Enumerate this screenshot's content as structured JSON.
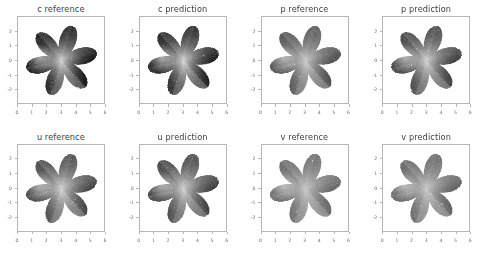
{
  "figure": {
    "rows": 2,
    "cols": 4,
    "background_color": "#ffffff",
    "axes_edge_color": "#b6b6b6",
    "tick_label_color": "#6f6f6f",
    "title_color": "#3d3d3d"
  },
  "chart_data": {
    "type": "scatter",
    "title": "",
    "subtitle": "",
    "xlabel": "",
    "ylabel": "",
    "grid": false,
    "legend": null,
    "colormap": "gray_r",
    "shared_axes": {
      "xlim": [
        0,
        6
      ],
      "ylim": [
        -3,
        3
      ],
      "xticks": [
        0,
        1,
        2,
        3,
        4,
        5,
        6
      ],
      "xticklabels": [
        "0",
        "1",
        "2",
        "3",
        "4",
        "5",
        "6"
      ],
      "yticks": [
        -2,
        -1,
        0,
        1,
        2
      ],
      "yticklabels": [
        "-2",
        "-1",
        "0",
        "1",
        "2"
      ]
    },
    "geometry": {
      "shape": "six-petal flower point cloud",
      "petals": 6,
      "center_x": 3.0,
      "center_y": 0.0,
      "inner_radius": 0.55,
      "outer_radius": 2.5,
      "rotation_deg": 12
    },
    "panels": [
      {
        "id": "c-reference",
        "title": "c reference",
        "field": "c",
        "kind": "reference",
        "row": 0,
        "col": 0,
        "value_range": [
          0.0,
          1.0
        ],
        "contrast": 1.0,
        "center_brightness": 0.82,
        "petal_brightness": 0.18,
        "seed": 11
      },
      {
        "id": "c-prediction",
        "title": "c prediction",
        "field": "c",
        "kind": "prediction",
        "row": 0,
        "col": 1,
        "value_range": [
          0.0,
          1.0
        ],
        "contrast": 0.98,
        "center_brightness": 0.84,
        "petal_brightness": 0.2,
        "seed": 12
      },
      {
        "id": "p-reference",
        "title": "p reference",
        "field": "p",
        "kind": "reference",
        "row": 0,
        "col": 2,
        "value_range": [
          0.0,
          1.0
        ],
        "contrast": 0.74,
        "center_brightness": 0.9,
        "petal_brightness": 0.34,
        "seed": 21
      },
      {
        "id": "p-prediction",
        "title": "p prediction",
        "field": "p",
        "kind": "prediction",
        "row": 0,
        "col": 3,
        "value_range": [
          0.0,
          1.0
        ],
        "contrast": 0.8,
        "center_brightness": 0.9,
        "petal_brightness": 0.28,
        "seed": 22
      },
      {
        "id": "u-reference",
        "title": "u reference",
        "field": "u",
        "kind": "reference",
        "row": 1,
        "col": 0,
        "value_range": [
          0.0,
          1.0
        ],
        "contrast": 0.78,
        "center_brightness": 0.92,
        "petal_brightness": 0.3,
        "seed": 31
      },
      {
        "id": "u-prediction",
        "title": "u prediction",
        "field": "u",
        "kind": "prediction",
        "row": 1,
        "col": 1,
        "value_range": [
          0.0,
          1.0
        ],
        "contrast": 0.8,
        "center_brightness": 0.9,
        "petal_brightness": 0.28,
        "seed": 32
      },
      {
        "id": "v-reference",
        "title": "v reference",
        "field": "v",
        "kind": "reference",
        "row": 1,
        "col": 2,
        "value_range": [
          0.0,
          1.0
        ],
        "contrast": 0.62,
        "center_brightness": 0.95,
        "petal_brightness": 0.44,
        "seed": 41
      },
      {
        "id": "v-prediction",
        "title": "v prediction",
        "field": "v",
        "kind": "prediction",
        "row": 1,
        "col": 3,
        "value_range": [
          0.0,
          1.0
        ],
        "contrast": 0.66,
        "center_brightness": 0.94,
        "petal_brightness": 0.42,
        "seed": 42
      }
    ]
  }
}
